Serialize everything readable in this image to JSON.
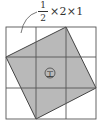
{
  "figure": {
    "annotation": {
      "fraction_numerator": "1",
      "fraction_denominator": "2",
      "expression_rest": "×2×1"
    },
    "grid": {
      "rows": 3,
      "cols": 3,
      "line_color": "#555555"
    },
    "square": {
      "fill_color": "#b9b9b9",
      "vertices": [
        [
          66,
          27
        ],
        [
          96,
          88
        ],
        [
          36,
          119
        ],
        [
          6,
          57
        ]
      ]
    },
    "center_label": "エ"
  }
}
